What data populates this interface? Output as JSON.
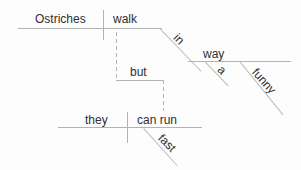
{
  "diagram": {
    "type": "sentence-diagram",
    "clause1": {
      "subject": "Ostriches",
      "verb": "walk",
      "prepositional_phrase": {
        "preposition": "in",
        "article": "a",
        "adjective": "funny",
        "object": "way"
      }
    },
    "conjunction": "but",
    "clause2": {
      "subject": "they",
      "verb": "can run",
      "adverb": "fast"
    }
  },
  "colors": {
    "line": "#b3b3b3",
    "text": "#2f2f2f",
    "background": "#fdfdfd"
  }
}
